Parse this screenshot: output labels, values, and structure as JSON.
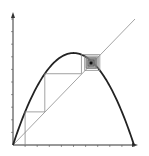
{
  "diagram": {
    "type": "cobweb-plot",
    "colors": {
      "background": "#ffffff",
      "axes": "#333333",
      "curve": "#222222",
      "diagonal": "#9a9a9a",
      "cobweb": "#8a8a8a",
      "fixed_point": "#111111"
    },
    "axes": {
      "x_ticks": 10,
      "y_ticks": 10,
      "x_label": "",
      "y_label": ""
    },
    "curve": {
      "name": "parabola f(x)",
      "peak_x": 0.5,
      "peak_y": 0.73
    },
    "diagonal": {
      "name": "y = x"
    },
    "cobweb_start_x": 0.1,
    "fixed_point_x": 0.64
  }
}
